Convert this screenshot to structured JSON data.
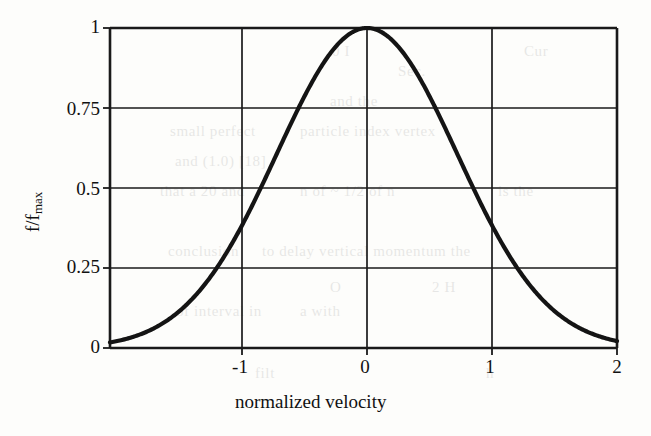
{
  "figure": {
    "background_color": "#fdfdfb",
    "ink_color": "#111111",
    "axis_color": "#1a1a1a"
  },
  "axis_titles": {
    "x": "normalized velocity",
    "y_main": "f/f",
    "y_sub": "max"
  },
  "ticks": {
    "y": [
      "1",
      "0.75",
      "0.5",
      "0.25",
      "0"
    ],
    "x": [
      "-1",
      "0",
      "1",
      "2"
    ]
  },
  "bleed_text": [
    {
      "text": "Sec.",
      "x": 398,
      "y": 56
    },
    {
      "text": "and the",
      "x": 330,
      "y": 86
    },
    {
      "text": "small perfect",
      "x": 170,
      "y": 116
    },
    {
      "text": "particle index vertex",
      "x": 300,
      "y": 116
    },
    {
      "text": "and (1.0) [18]",
      "x": 175,
      "y": 146
    },
    {
      "text": "that a 20 and",
      "x": 160,
      "y": 176
    },
    {
      "text": "n of ~ 1/2 of n",
      "x": 300,
      "y": 176
    },
    {
      "text": "is the",
      "x": 498,
      "y": 176
    },
    {
      "text": "conclusion",
      "x": 168,
      "y": 236
    },
    {
      "text": "to delay vertical momentum the",
      "x": 262,
      "y": 236
    },
    {
      "text": "of interval in",
      "x": 176,
      "y": 296
    },
    {
      "text": "a with",
      "x": 300,
      "y": 296
    },
    {
      "text": "filt",
      "x": 255,
      "y": 358
    },
    {
      "text": "h",
      "x": 486,
      "y": 358
    },
    {
      "text": "Cur",
      "x": 524,
      "y": 36
    },
    {
      "text": "0 I",
      "x": 332,
      "y": 36
    },
    {
      "text": "O",
      "x": 330,
      "y": 272
    },
    {
      "text": "2 H",
      "x": 432,
      "y": 272
    }
  ],
  "chart_data": {
    "type": "line",
    "title": "",
    "xlabel": "normalized velocity",
    "ylabel": "f/f_max",
    "xlim": [
      -2.056,
      2.0
    ],
    "ylim": [
      0,
      1
    ],
    "xticks": [
      -1,
      0,
      1,
      2
    ],
    "yticks": [
      0,
      0.25,
      0.5,
      0.75,
      1
    ],
    "grid": true,
    "legend": null,
    "model": {
      "function": "exp(-(x*x)/(2*sigma*sigma))",
      "sigma": 0.722,
      "peak_x": 0,
      "peak_y": 1
    },
    "x": [
      -2.056,
      -2.0,
      -1.9,
      -1.8,
      -1.7,
      -1.6,
      -1.5,
      -1.4,
      -1.3,
      -1.2,
      -1.1,
      -1.0,
      -0.9,
      -0.8,
      -0.7,
      -0.6,
      -0.5,
      -0.4,
      -0.3,
      -0.2,
      -0.1,
      0.0,
      0.1,
      0.2,
      0.3,
      0.4,
      0.5,
      0.6,
      0.7,
      0.8,
      0.9,
      1.0,
      1.1,
      1.2,
      1.3,
      1.4,
      1.5,
      1.6,
      1.7,
      1.8,
      1.9,
      2.0
    ],
    "y": [
      0.017,
      0.021,
      0.031,
      0.044,
      0.061,
      0.084,
      0.113,
      0.151,
      0.198,
      0.254,
      0.319,
      0.392,
      0.47,
      0.552,
      0.633,
      0.71,
      0.79,
      0.86,
      0.918,
      0.963,
      0.99,
      1.0,
      0.99,
      0.963,
      0.918,
      0.86,
      0.79,
      0.71,
      0.633,
      0.552,
      0.47,
      0.392,
      0.319,
      0.254,
      0.198,
      0.151,
      0.113,
      0.084,
      0.061,
      0.044,
      0.031,
      0.021
    ]
  },
  "geometry": {
    "plot_left_px": 110,
    "plot_right_px": 617,
    "plot_top_px": 28,
    "plot_bottom_px": 348,
    "px_per_x_unit": 125,
    "px_per_quarter_y": 80
  }
}
